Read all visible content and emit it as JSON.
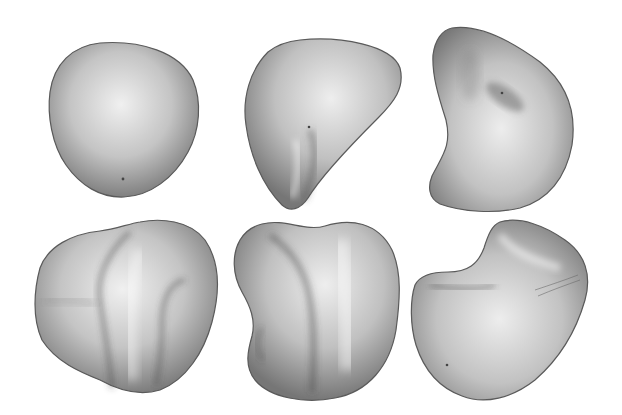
{
  "figure": {
    "background": "#ffffff",
    "layout": {
      "rows": 2,
      "cols": 3
    },
    "shapes": [
      {
        "id": "blob-1",
        "description": "smooth rounded rounded-triangular blob"
      },
      {
        "id": "blob-2",
        "description": "teardrop blob with a vertical crease at bottom"
      },
      {
        "id": "blob-3",
        "description": "kidney-shaped blob with dimple near top-right"
      },
      {
        "id": "blob-4",
        "description": "folded blob with two vertical grooves"
      },
      {
        "id": "blob-5",
        "description": "bean-shaped blob with diagonal groove"
      },
      {
        "id": "blob-6",
        "description": "saddle-shaped blob with raised top-right lobe"
      }
    ],
    "colors": {
      "light": "#f2f2f2",
      "mid": "#b4b4b4",
      "dark": "#6e6e6e",
      "edge": "#555555"
    }
  }
}
